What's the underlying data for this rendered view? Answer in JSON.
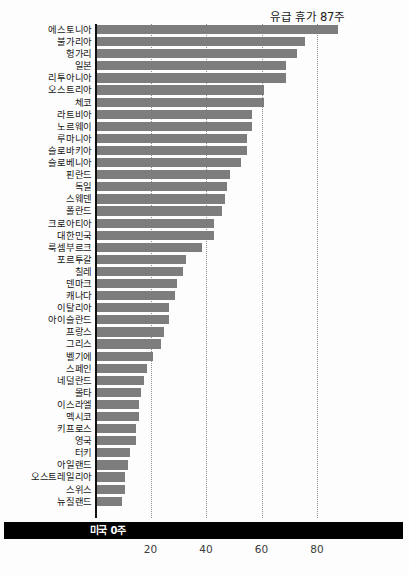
{
  "chart_data": {
    "type": "bar",
    "orientation": "horizontal",
    "title": "",
    "annotation": "유급 휴가 87주",
    "footer_label": "미국",
    "footer_value": "0주",
    "footer_text": "미국  0주",
    "xlabel": "",
    "ylabel": "",
    "xlim": [
      0,
      93
    ],
    "xticks": [
      20,
      40,
      60,
      80
    ],
    "xticklabels": [
      "20",
      "40",
      "60",
      "80"
    ],
    "grid": "vertical-dotted",
    "legend": "none",
    "bar_color": "#7d7d7d",
    "axis_color": "#111111",
    "gridline_color": "#8d8d8d",
    "unit": "주",
    "categories": [
      "에스토니아",
      "불가리아",
      "헝가리",
      "일본",
      "리투아니아",
      "오스트리아",
      "체코",
      "라트비아",
      "노르웨이",
      "루마니아",
      "슬로바키아",
      "슬로베니아",
      "핀란드",
      "독일",
      "스웨덴",
      "폴란드",
      "크로아티아",
      "대한민국",
      "룩셈부르크",
      "포르투갈",
      "칠레",
      "덴마크",
      "캐나다",
      "이탈리아",
      "아이슬란드",
      "프랑스",
      "그리스",
      "벨기에",
      "스페인",
      "네덜란드",
      "몰타",
      "이스라엘",
      "멕시코",
      "키프로스",
      "영국",
      "터키",
      "아일랜드",
      "오스트레일리아",
      "스위스",
      "뉴질랜드"
    ],
    "values": [
      87,
      75,
      72,
      68,
      68,
      60,
      60,
      56,
      56,
      54,
      54,
      52,
      48,
      47,
      46,
      45,
      42,
      42,
      38,
      32,
      31,
      29,
      28,
      26,
      26,
      24,
      23,
      20,
      18,
      17,
      16,
      15,
      15,
      14,
      14,
      12,
      11,
      10,
      10,
      9
    ]
  }
}
